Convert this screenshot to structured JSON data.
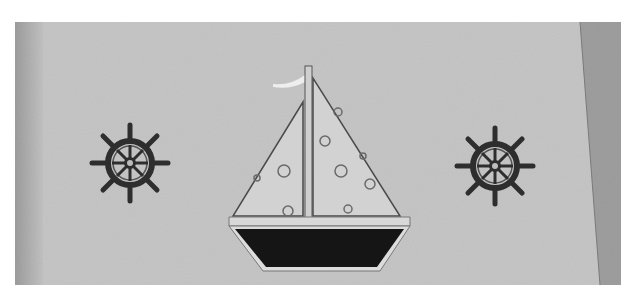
{
  "image": {
    "description": "Black-and-white photograph of a fabric panel with an appliqued sailboat flanked by two embroidered ship's wheels",
    "subjects": [
      {
        "name": "left ship's wheel",
        "position": "left"
      },
      {
        "name": "sailboat with polka-dot sails and dark hull",
        "position": "center"
      },
      {
        "name": "right ship's wheel",
        "position": "right"
      }
    ],
    "colors": {
      "page_background": "#ffffff",
      "fabric": "#c9c9c9",
      "fabric_edge_shadow": "#8a8a8a",
      "sail_fill": "#d4d4d4",
      "outline": "#4a4a4a",
      "hull": "#151515",
      "wheel": "#2e2e2e",
      "flag": "#eeeeee"
    }
  }
}
